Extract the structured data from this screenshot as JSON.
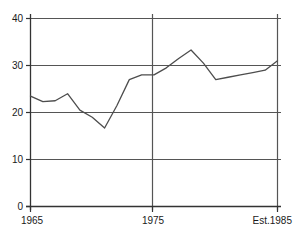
{
  "chart_data": {
    "type": "line",
    "title": "",
    "subtitle": "",
    "xlabel": "",
    "ylabel": "",
    "x": [
      1965,
      1966,
      1967,
      1968,
      1969,
      1970,
      1971,
      1972,
      1973,
      1974,
      1975,
      1976,
      1977,
      1978,
      1979,
      1980,
      1981,
      1982,
      1983,
      1984,
      1985
    ],
    "values": [
      23.5,
      22.3,
      22.5,
      24.0,
      20.5,
      19.0,
      16.7,
      21.5,
      27.0,
      28.0,
      28.0,
      29.5,
      31.5,
      33.3,
      30.5,
      27.0,
      27.5,
      28.0,
      28.5,
      29.0,
      31.0
    ],
    "series": [
      {
        "name": "series-1",
        "values": [
          23.5,
          22.3,
          22.5,
          24.0,
          20.5,
          19.0,
          16.7,
          21.5,
          27.0,
          28.0,
          28.0,
          29.5,
          31.5,
          33.3,
          30.5,
          27.0,
          27.5,
          28.0,
          28.5,
          29.0,
          31.0
        ]
      }
    ],
    "xlim": [
      1965,
      1985
    ],
    "ylim": [
      0,
      40
    ],
    "y_ticks": [
      0,
      10,
      20,
      30,
      40
    ],
    "y_tick_labels": [
      "0",
      "10",
      "20",
      "30",
      "40"
    ],
    "x_ticks": [
      1965,
      1975,
      1985
    ],
    "x_tick_labels": [
      "1965",
      "1975",
      "Est.1985"
    ],
    "grid": {
      "horizontal": true,
      "vertical": true,
      "horizontal_at": [
        10,
        20,
        30,
        40
      ],
      "vertical_at": [
        1965,
        1975,
        1985
      ]
    },
    "legend": {
      "visible": false,
      "position": "none"
    },
    "colors": {
      "line": "#4d4d4d",
      "grid": "#555555",
      "axis": "#333333",
      "text": "#1a1a1a",
      "background": "#ffffff"
    },
    "annotations": []
  },
  "axis": {
    "y_labels": [
      "40",
      "30",
      "20",
      "10",
      "0"
    ],
    "x_labels": [
      "1965",
      "1975",
      "Est.1985"
    ]
  }
}
